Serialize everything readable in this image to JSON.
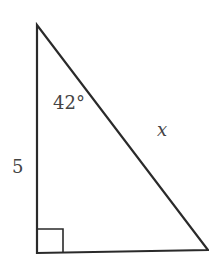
{
  "diagram": {
    "type": "right-triangle",
    "colors": {
      "stroke": "#2a2a2a",
      "label": "#444444",
      "background": "#ffffff"
    },
    "labels": {
      "angle": "42°",
      "hypotenuse": "x",
      "vertical_side": "5"
    },
    "right_angle_marker": true
  }
}
